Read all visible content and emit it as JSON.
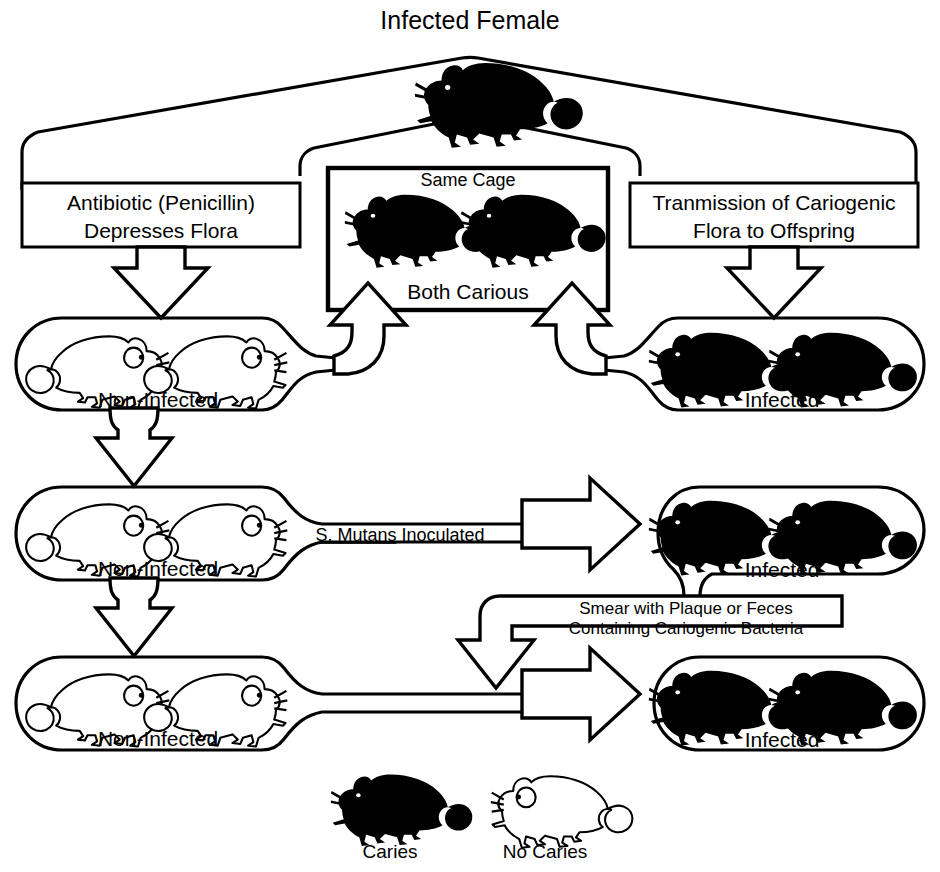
{
  "diagram": {
    "title": "Infected Female",
    "boxes": {
      "left_box_line1": "Antibiotic (Penicillin)",
      "left_box_line2": "Depresses Flora",
      "right_box_line1": "Tranmission of Cariogenic",
      "right_box_line2": "Flora to Offspring",
      "center_box_top": "Same Cage",
      "center_box_bottom": "Both Carious"
    },
    "capsules": [
      {
        "id": "row1-left",
        "label": "Non-Infected",
        "state": "non-infected",
        "mice": 2
      },
      {
        "id": "row1-right",
        "label": "Infected",
        "state": "infected",
        "mice": 2
      },
      {
        "id": "row2-left",
        "label": "Non-Infected",
        "state": "non-infected",
        "mice": 2
      },
      {
        "id": "row2-right",
        "label": "Infected",
        "state": "infected",
        "mice": 2
      },
      {
        "id": "row3-left",
        "label": "Non-Infected",
        "state": "non-infected",
        "mice": 2
      },
      {
        "id": "row3-right",
        "label": "Infected",
        "state": "infected",
        "mice": 2
      }
    ],
    "arrow_labels": {
      "inoculated_italic": "S. Mutans",
      "inoculated_rest": " Inoculated",
      "smear_line1": "Smear with Plaque or Feces",
      "smear_line2": "Containing Cariogenic Bacteria"
    },
    "legend": [
      {
        "icon": "black-mouse-icon",
        "label": "Caries"
      },
      {
        "icon": "white-mouse-icon",
        "label": "No Caries"
      }
    ],
    "colors": {
      "ink": "#000000",
      "paper": "#ffffff"
    }
  }
}
